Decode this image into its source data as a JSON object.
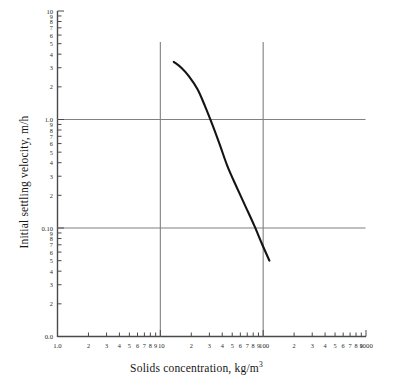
{
  "figure": {
    "background": "#ffffff",
    "ink": "#1a1a1a",
    "grid_color": "#808080",
    "curve_color": "#141414"
  },
  "axes": {
    "x_title": "Solids concentration, kg/m",
    "x_title_exponent": "3",
    "y_title": "Initial settling velocity, m/h",
    "x_tick_labels": [
      "1.0",
      "2",
      "3",
      "4",
      "5",
      "6",
      "7",
      "8",
      "9",
      "10",
      "2",
      "3",
      "4",
      "5",
      "6",
      "7",
      "8",
      "9",
      "100",
      "2",
      "3",
      "4",
      "5",
      "6",
      "7",
      "8",
      "9",
      "1000"
    ],
    "y_tick_labels_top": [
      "10",
      "9",
      "8",
      "7",
      "6",
      "5",
      "4",
      "3",
      "2"
    ],
    "y_tick_labels_mid": [
      "1.0",
      "9",
      "8",
      "7",
      "6",
      "5",
      "4",
      "3",
      "2"
    ],
    "y_tick_labels_low": [
      "0.10",
      "9",
      "8",
      "7",
      "6",
      "5",
      "4",
      "3",
      "2"
    ],
    "y_tick_label_bottom": "0.0"
  },
  "chart_data": {
    "type": "line",
    "title": "",
    "subtitle": "",
    "xlabel": "Solids concentration, kg/m3",
    "ylabel": "Initial settling velocity, m/h",
    "xscale": "log",
    "yscale": "log",
    "xlim": [
      1.0,
      1000
    ],
    "ylim": [
      0.01,
      10
    ],
    "grid": true,
    "grid_lines": {
      "vertical_x": [
        10,
        100
      ],
      "horizontal_y": [
        1.0,
        0.1
      ]
    },
    "legend": null,
    "annotations": [],
    "series": [
      {
        "name": "Initial settling velocity vs solids concentration",
        "x": [
          13.5,
          16,
          19,
          23,
          27,
          32,
          38,
          45,
          55,
          68,
          82,
          97,
          115
        ],
        "y": [
          3.4,
          3.0,
          2.5,
          1.9,
          1.35,
          0.9,
          0.58,
          0.37,
          0.24,
          0.155,
          0.105,
          0.072,
          0.05
        ]
      }
    ]
  }
}
